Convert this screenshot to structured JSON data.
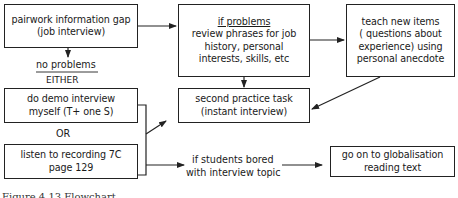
{
  "diagram": {
    "type": "flowchart",
    "nodes": {
      "pairwork": {
        "line1": "pairwork information gap",
        "line2": "(job interview)"
      },
      "if_problems": {
        "heading": "if problems",
        "line1": "review phrases for job",
        "line2": "history, personal",
        "line3": "interests, skills, etc"
      },
      "teach": {
        "line1": "teach new items",
        "line2": "( questions about",
        "line3": "experience) using",
        "line4": "personal anecdote"
      },
      "demo": {
        "line1": "do demo interview",
        "line2": "myself (T+ one S)"
      },
      "second_task": {
        "line1": "second practice task",
        "line2": "(instant interview)"
      },
      "listen": {
        "line1": "listen to recording 7C",
        "line2": "page 129"
      },
      "globalisation": {
        "line1": "go on to globalisation",
        "line2": "reading text"
      }
    },
    "labels": {
      "no_problems": "no problems",
      "either": "EITHER",
      "or": "OR",
      "bored_line1": "if students bored",
      "bored_line2": "with interview topic"
    },
    "edges": [
      {
        "from": "pairwork",
        "to": "if_problems"
      },
      {
        "from": "pairwork",
        "to": "demo_or_listen",
        "label": "no problems / EITHER"
      },
      {
        "from": "if_problems",
        "to": "teach"
      },
      {
        "from": "if_problems",
        "to": "second_task"
      },
      {
        "from": "teach",
        "to": "second_task"
      },
      {
        "from": "demo_or_listen",
        "to": "second_task"
      },
      {
        "from": "demo_or_listen",
        "to": "globalisation",
        "label": "if students bored with interview topic"
      }
    ],
    "caption": "Figure 4.13   Flowchart"
  },
  "colors": {
    "ink": "#222222",
    "background": "#ffffff"
  }
}
